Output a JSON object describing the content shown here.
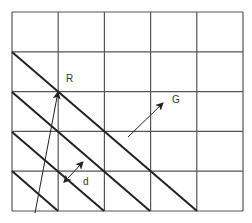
{
  "diagram": {
    "title": "",
    "grid": {
      "columns": 5,
      "rows": 5,
      "x0": 12,
      "y0": 12,
      "x1": 243,
      "y1": 211,
      "line_color": "#555555"
    },
    "family_lines": {
      "description": "Parallel lattice planes",
      "color": "#222222",
      "segments": [
        [
          12,
          52,
          197,
          211
        ],
        [
          12,
          92,
          150,
          211
        ],
        [
          12,
          132,
          104,
          211
        ],
        [
          12,
          171,
          58,
          211
        ]
      ]
    },
    "vectors": [
      {
        "name": "R",
        "label": "R",
        "from": [
          35,
          213
        ],
        "to": [
          58,
          92
        ],
        "label_pos": [
          66,
          82
        ]
      },
      {
        "name": "G",
        "label": "G",
        "from": [
          128,
          137
        ],
        "to": [
          163,
          103
        ],
        "label_pos": [
          172,
          103
        ]
      }
    ],
    "spacing": {
      "label": "d",
      "from": [
        68,
        178
      ],
      "to": [
        83,
        162
      ],
      "label_pos": [
        83,
        185
      ]
    }
  }
}
